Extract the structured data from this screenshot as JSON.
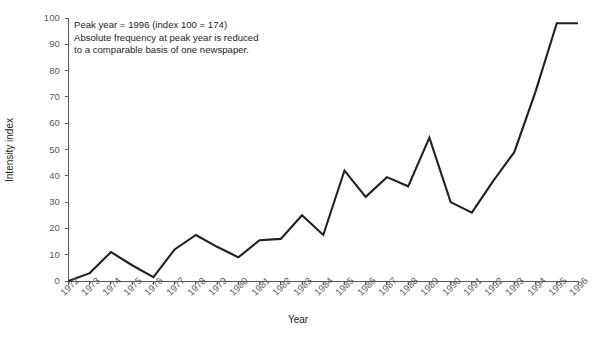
{
  "chart_data": {
    "type": "line",
    "title": "",
    "xlabel": "Year",
    "ylabel": "Intensity index",
    "categories": [
      1972,
      1973,
      1974,
      1975,
      1976,
      1977,
      1978,
      1979,
      1980,
      1981,
      1982,
      1983,
      1984,
      1985,
      1986,
      1987,
      1988,
      1989,
      1990,
      1991,
      1992,
      1993,
      1994,
      1995,
      1996
    ],
    "x_tick_labels": [
      "1972",
      "1973",
      "1974",
      "1975",
      "1976",
      "1977",
      "1978",
      "1979",
      "1980",
      "1981",
      "1982",
      "1983",
      "1984",
      "1985",
      "1986",
      "1987",
      "1988",
      "1989",
      "1990",
      "1991",
      "1992",
      "1993",
      "1994",
      "1995",
      "1996"
    ],
    "y_tick_labels": [
      "0",
      "10",
      "20",
      "30",
      "40",
      "50",
      "60",
      "70",
      "80",
      "90",
      "100"
    ],
    "y_ticks": [
      0,
      10,
      20,
      30,
      40,
      50,
      60,
      70,
      80,
      90,
      100
    ],
    "values": [
      0,
      3,
      11,
      6,
      1.5,
      12,
      17.5,
      13,
      9,
      15.5,
      16,
      25,
      17.5,
      42,
      32,
      39.5,
      36,
      54.5,
      30,
      26,
      38,
      49,
      72,
      98,
      98
    ],
    "ylim": [
      0,
      100
    ],
    "grid": false,
    "legend": null,
    "series": [
      {
        "name": "Intensity index",
        "color": "#221f1f",
        "values": [
          0,
          3,
          11,
          6,
          1.5,
          12,
          17.5,
          13,
          9,
          15.5,
          16,
          25,
          17.5,
          42,
          32,
          39.5,
          36,
          54.5,
          30,
          26,
          38,
          49,
          72,
          98,
          98
        ]
      }
    ],
    "annotations": [
      {
        "lines": [
          "Peak year = 1996 (index 100 = 174)",
          "Absolute frequency at peak year is reduced",
          "to a comparable basis of one newspaper."
        ]
      }
    ]
  },
  "annotation": {
    "line1": "Peak year = 1996 (index 100 = 174)",
    "line2": "Absolute frequency at peak year is reduced",
    "line3": "to a comparable basis of one newspaper."
  },
  "axes": {
    "x_title": "Year",
    "y_title": "Intensity index"
  }
}
